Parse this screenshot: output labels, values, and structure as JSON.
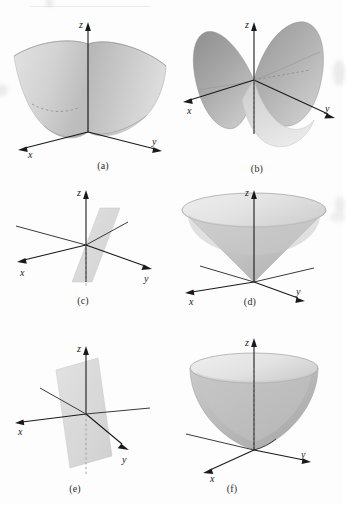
{
  "page": {
    "background_color": "#fdfdfd",
    "ink_color": "#1a1a1a",
    "surface_fill_light": "#dcdcdc",
    "surface_fill_mid": "#c2c2c2",
    "surface_fill_dark": "#9a9a9a",
    "width": 343,
    "height": 505
  },
  "axes": {
    "x_label": "x",
    "y_label": "y",
    "z_label": "z"
  },
  "panels": [
    {
      "id": "a",
      "caption": "(a)",
      "surface": "parabolic-trough",
      "description": "Upward opening parabolic trough / elliptic paraboloid seen from the side",
      "axis_labels": {
        "x": "x",
        "y": "y",
        "z": "z"
      }
    },
    {
      "id": "b",
      "caption": "(b)",
      "surface": "hyperbolic-paraboloid",
      "description": "Saddle shaped hyperbolic paraboloid with two raised lobes",
      "axis_labels": {
        "x": "x",
        "y": "y",
        "z": "z"
      }
    },
    {
      "id": "c",
      "caption": "(c)",
      "surface": "vertical-plane",
      "description": "Vertical plane through the z axis",
      "axis_labels": {
        "x": "x",
        "y": "y",
        "z": "z"
      }
    },
    {
      "id": "d",
      "caption": "(d)",
      "surface": "cone",
      "description": "Circular cone opening upward with apex at the origin",
      "axis_labels": {
        "x": "x",
        "y": "y",
        "z": "z"
      }
    },
    {
      "id": "e",
      "caption": "(e)",
      "surface": "vertical-plane",
      "description": "Vertical plane through the z axis at a second orientation",
      "axis_labels": {
        "x": "x",
        "y": "y",
        "z": "z"
      }
    },
    {
      "id": "f",
      "caption": "(f)",
      "surface": "elliptic-paraboloid",
      "description": "Elliptic paraboloid opening upward with vertex at the origin",
      "axis_labels": {
        "x": "x",
        "y": "y",
        "z": "z"
      }
    }
  ]
}
